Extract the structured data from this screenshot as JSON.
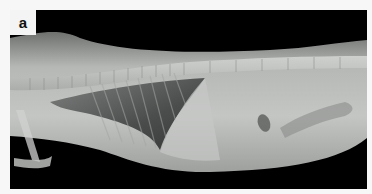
{
  "figure": {
    "panel_label": "a",
    "image_type": "lateral-radiograph",
    "colors": {
      "background": "#000000",
      "soft_tissue": "#b8bcb8",
      "lung_field": "#4a4c4c",
      "page": "#f7f7f7"
    }
  }
}
